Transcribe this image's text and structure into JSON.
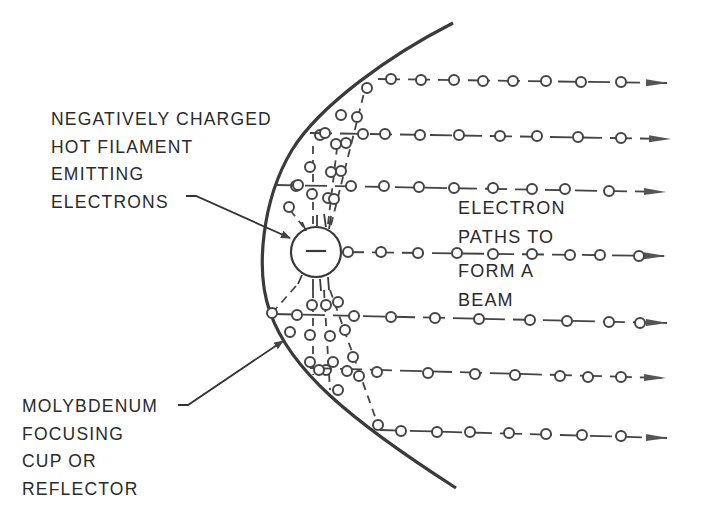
{
  "diagram": {
    "colors": {
      "ink": "#3a3a3a",
      "background": "#ffffff"
    },
    "labels": {
      "filament": [
        "NEGATIVELY CHARGED",
        "HOT FILAMENT",
        "EMITTING",
        "ELECTRONS"
      ],
      "beam": [
        "ELECTRON",
        "PATHS TO",
        "FORM A",
        "BEAM"
      ],
      "cup": [
        "MOLYBDENUM",
        "FOCUSING",
        "CUP OR",
        "REFLECTOR"
      ]
    },
    "filament_symbol": "−",
    "components": {
      "focusing_cup": "parabolic reflector curve",
      "filament": "circle with negative sign",
      "beam_rows": 7,
      "arrow_direction": "right"
    }
  }
}
